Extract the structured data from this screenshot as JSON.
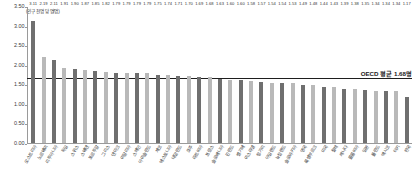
{
  "chart_data": {
    "type": "bar",
    "title": "",
    "subtitle": "",
    "unit_caption": "(인구 천명 당 명/명)",
    "xlabel": "",
    "ylabel": "",
    "ylim": [
      0.0,
      3.5
    ],
    "ytick_labels": [
      "0.00",
      "0.50",
      "1.00",
      "1.50",
      "2.00",
      "2.50",
      "3.00",
      "3.50"
    ],
    "ytick_values": [
      0.0,
      0.5,
      1.0,
      1.5,
      2.0,
      2.5,
      3.0,
      3.5
    ],
    "grid": false,
    "legend": "none",
    "categories": [
      "오스트리아",
      "노르웨이",
      "리투아니아",
      "독일",
      "스위스",
      "스웨덴",
      "포르투갈",
      "그리스",
      "덴마크",
      "이탈리아",
      "스페인",
      "아이슬란드",
      "체코",
      "에스토니아",
      "네덜란드",
      "호주",
      "라트비아",
      "프랑스",
      "슬로베니아",
      "핀란드",
      "벨기에",
      "이스라엘",
      "헝가리",
      "아일랜드",
      "뉴질랜드",
      "슬로바키아",
      "영국",
      "룩셈부르크",
      "미국",
      "칠레",
      "캐나다",
      "콜롬비아",
      "일본",
      "폴란드",
      "멕시코",
      "터키",
      "한국"
    ],
    "values": [
      3.11,
      2.19,
      2.11,
      1.91,
      1.9,
      1.87,
      1.85,
      1.82,
      1.79,
      1.79,
      1.79,
      1.79,
      1.75,
      1.74,
      1.71,
      1.7,
      1.69,
      1.68,
      1.63,
      1.6,
      1.6,
      1.58,
      1.57,
      1.54,
      1.54,
      1.53,
      1.49,
      1.48,
      1.44,
      1.43,
      1.39,
      1.38,
      1.35,
      1.34,
      1.34,
      1.34,
      1.17
    ],
    "value_labels": [
      "3.11",
      "2.19",
      "2.11",
      "1.91",
      "1.90",
      "1.87",
      "1.85",
      "1.82",
      "1.79",
      "1.79",
      "1.79",
      "1.79",
      "1.75",
      "1.74",
      "1.71",
      "1.70",
      "1.69",
      "1.68",
      "1.63",
      "1.60",
      "1.60",
      "1.58",
      "1.57",
      "1.54",
      "1.54",
      "1.53",
      "1.49",
      "1.48",
      "1.44",
      "1.43",
      "1.39",
      "1.38",
      "1.35",
      "1.34",
      "1.34",
      "1.34",
      "1.17"
    ],
    "annotations": [
      {
        "name": "oecd-average-line",
        "label": "OECD 평균 1.68명",
        "value": 1.68,
        "orientation": "horizontal"
      }
    ],
    "colors": {
      "bar_dark": "#6f6f6f",
      "bar_light": "#b9b9b9",
      "axis": "#9a9a9a",
      "average_line": "#1e1e1e",
      "text": "#333333",
      "background": "#ffffff"
    }
  }
}
